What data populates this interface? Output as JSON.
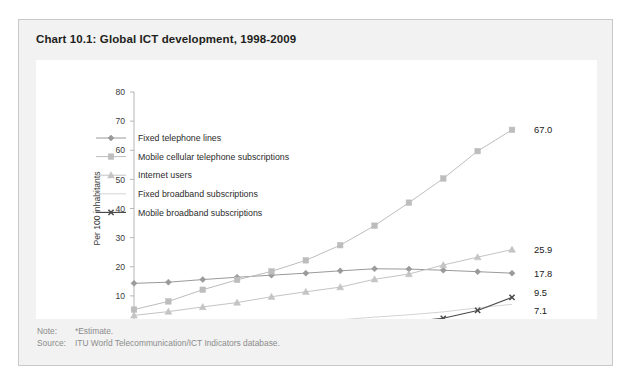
{
  "card": {
    "title": "Chart 10.1: Global ICT development, 1998-2009"
  },
  "footer": {
    "note_key": "Note:",
    "note_value": "*Estimate.",
    "source_key": "Source:",
    "source_value": "ITU World Telecommunication/ICT Indicators database."
  },
  "chart_data": {
    "type": "line",
    "title": "Chart 10.1: Global ICT development, 1998-2009",
    "xlabel": "",
    "ylabel": "Per 100 inhabitants",
    "categories": [
      "98",
      "99",
      "2000",
      "01",
      "02",
      "03",
      "04",
      "05",
      "06",
      "07",
      "08",
      "09*"
    ],
    "ylim": [
      0,
      80
    ],
    "yticks": [
      0,
      10,
      20,
      30,
      40,
      50,
      60,
      70,
      80
    ],
    "grid": false,
    "legend_position": "inside-upper-left",
    "series": [
      {
        "name": "Fixed telephone lines",
        "marker": "diamond",
        "color": "#9a9a9a",
        "values": [
          14.3,
          14.7,
          15.6,
          16.4,
          17.1,
          17.8,
          18.6,
          19.3,
          19.2,
          18.8,
          18.3,
          17.8
        ],
        "end_label": "17.8"
      },
      {
        "name": "Mobile cellular telephone subscriptions",
        "marker": "square",
        "color": "#bdbdbd",
        "values": [
          5.3,
          8.1,
          12.1,
          15.5,
          18.4,
          22.2,
          27.4,
          34.1,
          42.0,
          50.3,
          59.7,
          67.0
        ],
        "end_label": "67.0"
      },
      {
        "name": "Internet users",
        "marker": "triangle",
        "color": "#c4c4c4",
        "values": [
          3.3,
          4.6,
          6.2,
          7.7,
          9.7,
          11.4,
          13.0,
          15.7,
          17.5,
          20.6,
          23.3,
          25.9
        ],
        "end_label": "25.9"
      },
      {
        "name": "Fixed broadband subscriptions",
        "marker": "none",
        "color": "#d4d4d4",
        "values": [
          0.0,
          0.0,
          0.1,
          0.3,
          0.6,
          1.1,
          1.8,
          2.7,
          3.5,
          4.5,
          5.9,
          7.1
        ],
        "end_label": "7.1"
      },
      {
        "name": "Mobile broadband subscriptions",
        "marker": "x",
        "color": "#4a4a4a",
        "values": [
          0.0,
          0.0,
          0.0,
          0.0,
          0.0,
          0.1,
          0.2,
          0.5,
          1.1,
          2.3,
          5.0,
          9.5
        ],
        "end_label": "9.5"
      }
    ]
  }
}
